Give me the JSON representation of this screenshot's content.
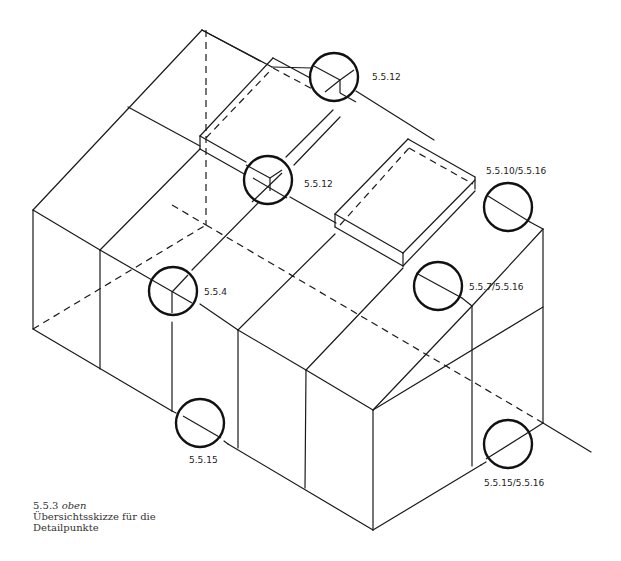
{
  "figure": {
    "caption": {
      "number": "5.5.3",
      "position_word": "oben",
      "line2": "Übersichtsskizze für die",
      "line3": "Detailpunkte"
    },
    "detail_markers": [
      {
        "id": "m1",
        "label": "5.5.12",
        "cx": 334,
        "cy": 77,
        "r": 24
      },
      {
        "id": "m2",
        "label": "5.5.12",
        "cx": 268,
        "cy": 180,
        "r": 24
      },
      {
        "id": "m3",
        "label": "5.5.10/5.5.16",
        "cx": 508,
        "cy": 207,
        "r": 24
      },
      {
        "id": "m4",
        "label": "5.5.7/5.5.16",
        "cx": 438,
        "cy": 286,
        "r": 24
      },
      {
        "id": "m5",
        "label": "5.5.4",
        "cx": 173,
        "cy": 291,
        "r": 24
      },
      {
        "id": "m6",
        "label": "5.5.15",
        "cx": 200,
        "cy": 423,
        "r": 24
      },
      {
        "id": "m7",
        "label": "5.5.15/5.5.16",
        "cx": 508,
        "cy": 444,
        "r": 24
      }
    ],
    "colors": {
      "line": "#1a1a1a",
      "background": "#ffffff",
      "text": "#222222"
    }
  }
}
